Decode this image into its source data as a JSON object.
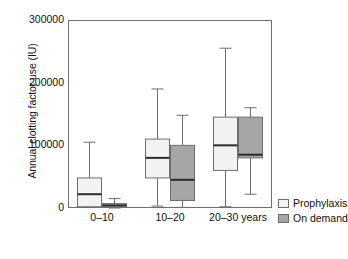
{
  "chart_data": {
    "type": "box",
    "title": "",
    "xlabel": "",
    "ylabel": "Annual clotting factor use (IU)",
    "ylim": [
      0,
      300000
    ],
    "ytick_labels": [
      "300000",
      "200000",
      "100000",
      "0"
    ],
    "ytick_values": [
      300000,
      200000,
      100000,
      0
    ],
    "grid": false,
    "legend_position": "right-bottom-outside",
    "categories": [
      "0–10",
      "10–20",
      "20–30 years"
    ],
    "legend": [
      {
        "name": "Prophylaxis",
        "color": "#f2f2f2"
      },
      {
        "name": "On demand",
        "color": "#a6a6a6"
      }
    ],
    "series": [
      {
        "name": "Prophylaxis",
        "color": "#f2f2f2",
        "boxes": [
          {
            "category": "0–10",
            "whisker_low": 1500,
            "q1": 2000,
            "median": 22000,
            "q3": 48000,
            "whisker_high": 105000
          },
          {
            "category": "10–20",
            "whisker_low": 3000,
            "q1": 48000,
            "median": 80000,
            "q3": 110000,
            "whisker_high": 190000
          },
          {
            "category": "20–30 years",
            "whisker_low": 2000,
            "q1": 60000,
            "median": 100000,
            "q3": 145000,
            "whisker_high": 255000
          }
        ]
      },
      {
        "name": "On demand",
        "color": "#a6a6a6",
        "boxes": [
          {
            "category": "0–10",
            "whisker_low": 0,
            "q1": 1000,
            "median": 4000,
            "q3": 7000,
            "whisker_high": 15000
          },
          {
            "category": "10–20",
            "whisker_low": 1000,
            "q1": 12000,
            "median": 45000,
            "q3": 100000,
            "whisker_high": 148000
          },
          {
            "category": "20–30 years",
            "whisker_low": 22000,
            "q1": 80000,
            "median": 85000,
            "q3": 145000,
            "whisker_high": 160000
          }
        ]
      }
    ]
  },
  "axis": {
    "y_title": "Annual clotting factor use (IU)",
    "y_ticks": [
      {
        "label": "300000",
        "value": 300000
      },
      {
        "label": "200000",
        "value": 200000
      },
      {
        "label": "100000",
        "value": 100000
      },
      {
        "label": "0",
        "value": 0
      }
    ],
    "x_ticks": [
      {
        "label": "0–10"
      },
      {
        "label": "10–20"
      },
      {
        "label": "20–30 years"
      }
    ]
  },
  "legend": {
    "items": [
      {
        "label": "Prophylaxis",
        "color": "#f2f2f2"
      },
      {
        "label": "On demand",
        "color": "#a6a6a6"
      }
    ]
  },
  "colors": {
    "prophylaxis_fill": "#f2f2f2",
    "on_demand_fill": "#a6a6a6",
    "box_stroke": "#6e6e6e",
    "median_stroke": "#2b2b2b",
    "frame_stroke": "#6e6e6e",
    "text": "#111111"
  }
}
